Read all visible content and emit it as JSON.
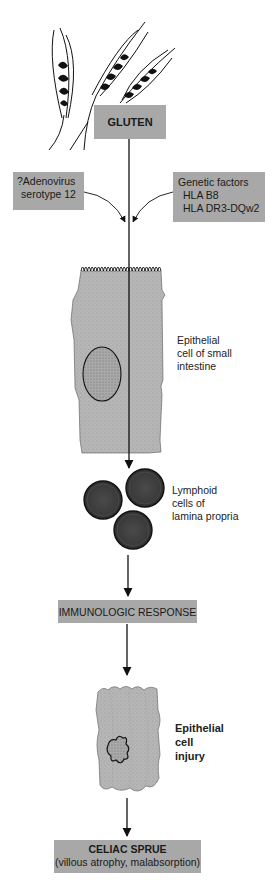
{
  "diagram": {
    "colors": {
      "box_fill": "#a8a8a8",
      "cell_fill": "#b4b4b4",
      "lymphoid_fill": "#3a3a3a",
      "line": "#111111"
    },
    "nodes": {
      "gluten": {
        "label": "GLUTEN"
      },
      "adenovirus": {
        "line1": "?Adenovirus",
        "line2": "serotype 12"
      },
      "genetic": {
        "line1": "Genetic factors",
        "line2": "HLA B8",
        "line3": "HLA DR3-DQw2"
      },
      "epithelial_cell": {
        "line1": "Epithelial",
        "line2": "cell of small",
        "line3": "intestine"
      },
      "lymphoid": {
        "line1": "Lymphoid",
        "line2": "cells of",
        "line3": "lamina propria"
      },
      "immunologic": {
        "label": "IMMUNOLOGIC RESPONSE"
      },
      "injury": {
        "line1": "Epithelial",
        "line2": "cell",
        "line3": "injury"
      },
      "celiac": {
        "title": "CELIAC SPRUE",
        "subtitle": "(villous atrophy, malabsorption)"
      }
    },
    "illustrations": [
      "wheat-stalks",
      "epithelial-cell",
      "lymphoid-cells",
      "injured-epithelial-cell"
    ],
    "edges": [
      {
        "from": "gluten",
        "to": "lymphoid"
      },
      {
        "from": "adenovirus",
        "to": "gluten-pathway"
      },
      {
        "from": "genetic",
        "to": "gluten-pathway"
      },
      {
        "from": "lymphoid",
        "to": "immunologic"
      },
      {
        "from": "immunologic",
        "to": "injury"
      },
      {
        "from": "injury",
        "to": "celiac"
      }
    ]
  }
}
